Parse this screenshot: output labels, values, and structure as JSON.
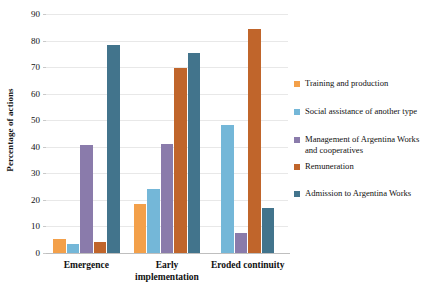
{
  "chart_data": {
    "type": "bar",
    "title": "",
    "subtitle": "",
    "xlabel": "",
    "ylabel": "Percentage of actions",
    "ylim": [
      0,
      90
    ],
    "yticks": [
      0,
      10,
      20,
      30,
      40,
      50,
      60,
      70,
      80,
      90
    ],
    "ytick_labels": [
      "0",
      "10",
      "20",
      "30",
      "40",
      "50",
      "60",
      "70",
      "80",
      "90"
    ],
    "grid": true,
    "legend_position": "right",
    "categories": [
      "Emergence",
      "Early implementation",
      "Eroded continuity"
    ],
    "category_lines": [
      [
        "Emergence"
      ],
      [
        "Early",
        "implementation"
      ],
      [
        "Eroded continuity"
      ]
    ],
    "series": [
      {
        "name": "Training and production",
        "color": "#f3a04a",
        "values": [
          5.3,
          18.5,
          null
        ]
      },
      {
        "name": "Social assistance of another type",
        "color": "#74b7d8",
        "values": [
          3.4,
          24.0,
          48.2
        ]
      },
      {
        "name": "Management of Argentina Works and cooperatives",
        "color": "#8a7bab",
        "values": [
          40.8,
          41.2,
          7.5
        ]
      },
      {
        "name": "Remuneration",
        "color": "#c0652b",
        "values": [
          4.0,
          69.5,
          84.5
        ]
      },
      {
        "name": "Admission to Argentina Works",
        "color": "#42748c",
        "values": [
          78.3,
          75.3,
          17.1
        ]
      }
    ],
    "legend_entries": [
      "Training and production",
      "Social assistance of another type",
      "Management of Argentina Works\nand cooperatives",
      "Remuneration",
      "Admission to Argentina Works"
    ]
  }
}
